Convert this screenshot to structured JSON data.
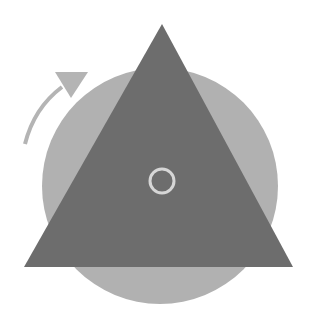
{
  "diagram": {
    "width": 316,
    "height": 318,
    "background": "#ffffff",
    "circle": {
      "cx": 160,
      "cy": 186,
      "r": 118,
      "color": "#b1b1b1"
    },
    "triangle": {
      "points": "162,24 24,267 293,267",
      "color": "#6d6d6d"
    },
    "center_ring": {
      "cx": 162,
      "cy": 181,
      "r": 12,
      "stroke": "#d6d6d6",
      "stroke_width": 3
    },
    "rotation_arrow": {
      "direction": "clockwise",
      "arc_path": "M 25 144 Q 34 108 62 87",
      "color": "#b4b4b4",
      "stroke_width": 4,
      "head_points": "88,72 55,72 71,98"
    }
  }
}
